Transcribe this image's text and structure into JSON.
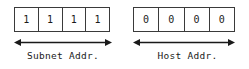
{
  "diagram": {
    "background_color": "#ffffff",
    "line_color": "#3a3a3a",
    "text_color": "#1a1a1a",
    "groups": [
      {
        "id": "subnet",
        "label": "Subnet Addr.",
        "bits": [
          "1",
          "1",
          "1",
          "1"
        ]
      },
      {
        "id": "host",
        "label": "Host Addr.",
        "bits": [
          "0",
          "0",
          "0",
          "0"
        ]
      }
    ]
  }
}
